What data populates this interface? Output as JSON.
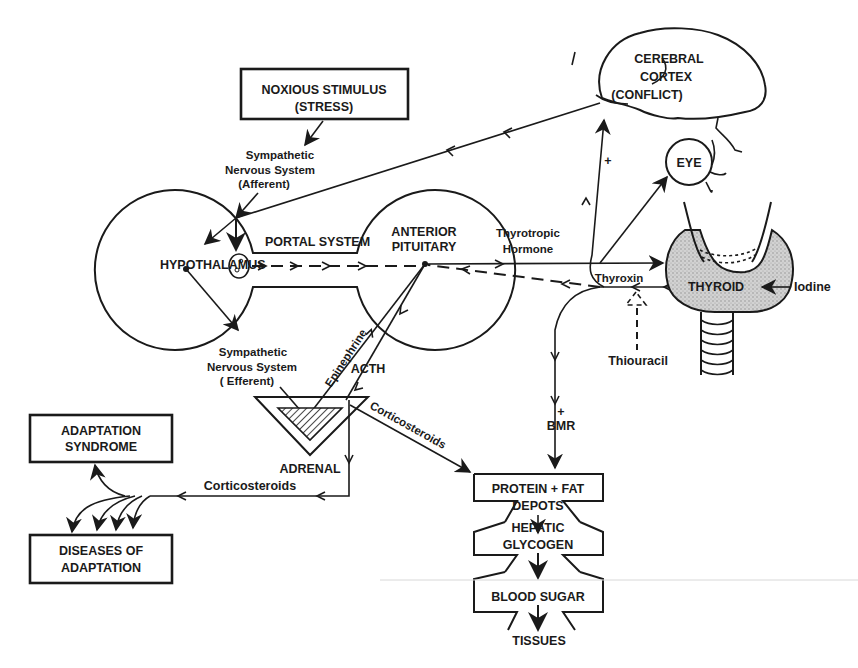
{
  "diagram": {
    "type": "physiological flow diagram",
    "nodes": {
      "noxious_stimulus": {
        "line1": "NOXIOUS  STIMULUS",
        "line2": "(STRESS)"
      },
      "cerebral_cortex": {
        "line1": "CEREBRAL",
        "line2": "CORTEX",
        "line3": "(CONFLICT)"
      },
      "eye": {
        "label": "EYE"
      },
      "hypothalamus": {
        "label": "HYPOTHALAMUS"
      },
      "portal_system": {
        "label": "PORTAL SYSTEM"
      },
      "anterior_pituitary": {
        "line1": "ANTERIOR",
        "line2": "PITUITARY"
      },
      "thyroid": {
        "label": "THYROID"
      },
      "adrenal": {
        "label": "ADRENAL"
      },
      "adaptation_syndrome": {
        "line1": "ADAPTATION",
        "line2": "SYNDROME"
      },
      "diseases_of_adaptation": {
        "line1": "DISEASES OF",
        "line2": "ADAPTATION"
      },
      "protein_fat_depots": {
        "line1": "PROTEIN + FAT",
        "line2": "DEPOTS"
      },
      "hepatic_glycogen": {
        "line1": "HEPATIC",
        "line2": "GLYCOGEN"
      },
      "blood_sugar": {
        "label": "BLOOD SUGAR"
      },
      "tissues": {
        "label": "TISSUES"
      }
    },
    "edge_labels": {
      "sns_afferent": {
        "line1": "Sympathetic",
        "line2": "Nervous System",
        "line3": "(Afferent)"
      },
      "sns_efferent": {
        "line1": "Sympathetic",
        "line2": "Nervous  System",
        "line3": "( Efferent)"
      },
      "thyrotropic": {
        "line1": "Thyrotropic",
        "line2": "Hormone"
      },
      "thyroxin": "Thyroxin",
      "iodine": "Iodine",
      "thiouracil": "Thiouracil",
      "epinephrine": "Epinephrine",
      "acth": "ACTH",
      "corticosteroids_diag": "Corticosteroids",
      "corticosteroids_horiz": "Corticosteroids",
      "bmr_plus": "+",
      "bmr": "BMR",
      "cortex_plus": "+"
    },
    "colors": {
      "ink": "#1a1a1a",
      "paper": "#ffffff",
      "thyroid_fill": "#c8c8c8"
    }
  }
}
